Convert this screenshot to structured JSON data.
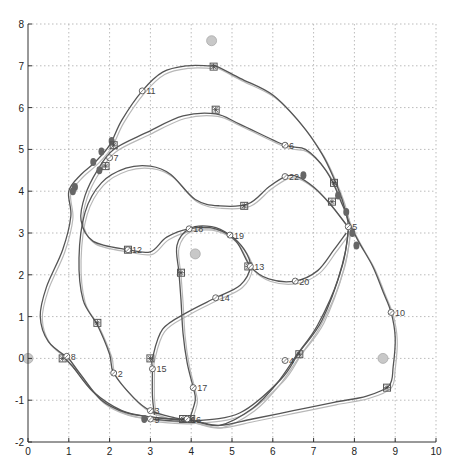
{
  "chart_data": {
    "type": "line",
    "title": "",
    "xlabel": "",
    "ylabel": "",
    "xlim": [
      0,
      10
    ],
    "ylim": [
      -2,
      8
    ],
    "x_ticks": [
      0,
      1,
      2,
      3,
      4,
      5,
      6,
      7,
      8,
      9,
      10
    ],
    "y_ticks": [
      -2,
      -1,
      0,
      1,
      2,
      3,
      4,
      5,
      6,
      7,
      8
    ],
    "grid": true,
    "legend": null,
    "colors": {
      "estimate": "#555555",
      "ground_truth": "#b8b8b8",
      "landmark": "#c8c8c8",
      "axis": "#333333",
      "grid": "#bbbbbb"
    },
    "landmarks": [
      {
        "x": 4.5,
        "y": 7.6
      },
      {
        "x": 4.1,
        "y": 2.5
      },
      {
        "x": 8.7,
        "y": 0.0
      },
      {
        "x": 0.0,
        "y": 0.0
      }
    ],
    "series": [
      {
        "name": "estimated trajectory",
        "points": [
          [
            1.0,
            0.0
          ],
          [
            0.5,
            0.4
          ],
          [
            0.3,
            1.0
          ],
          [
            0.45,
            1.7
          ],
          [
            0.85,
            2.6
          ],
          [
            1.05,
            3.4
          ],
          [
            1.0,
            4.0
          ],
          [
            1.3,
            4.4
          ],
          [
            1.65,
            4.7
          ],
          [
            2.0,
            5.1
          ],
          [
            2.3,
            5.7
          ],
          [
            2.8,
            6.4
          ],
          [
            3.3,
            6.85
          ],
          [
            3.9,
            7.0
          ],
          [
            4.45,
            7.0
          ],
          [
            4.6,
            7.0
          ],
          [
            5.2,
            6.7
          ],
          [
            6.0,
            6.3
          ],
          [
            6.7,
            5.6
          ],
          [
            7.2,
            4.9
          ],
          [
            7.5,
            4.3
          ],
          [
            7.7,
            3.8
          ],
          [
            7.85,
            3.3
          ],
          [
            8.1,
            2.8
          ],
          [
            8.45,
            2.2
          ],
          [
            8.7,
            1.6
          ],
          [
            8.9,
            1.1
          ],
          [
            9.0,
            0.5
          ],
          [
            8.95,
            -0.2
          ],
          [
            8.85,
            -0.65
          ],
          [
            8.3,
            -0.9
          ],
          [
            7.5,
            -1.05
          ],
          [
            6.5,
            -1.25
          ],
          [
            5.5,
            -1.45
          ],
          [
            4.7,
            -1.6
          ],
          [
            4.1,
            -1.5
          ],
          [
            3.5,
            -1.45
          ],
          [
            3.0,
            -1.4
          ],
          [
            2.3,
            -1.25
          ],
          [
            1.6,
            -0.8
          ],
          [
            1.1,
            -0.2
          ],
          [
            0.9,
            0.0
          ]
        ]
      },
      {
        "name": "estimated trajectory",
        "points": [
          [
            1.0,
            0.0
          ],
          [
            1.3,
            -0.4
          ],
          [
            1.8,
            -1.0
          ],
          [
            2.4,
            -1.3
          ],
          [
            3.0,
            -1.4
          ],
          [
            3.5,
            -1.45
          ],
          [
            4.0,
            -1.48
          ],
          [
            4.7,
            -1.6
          ],
          [
            5.5,
            -1.2
          ],
          [
            6.1,
            -0.6
          ],
          [
            6.6,
            0.1
          ],
          [
            7.1,
            0.8
          ],
          [
            7.6,
            1.9
          ],
          [
            7.85,
            3.1
          ],
          [
            7.65,
            3.8
          ],
          [
            7.3,
            4.5
          ],
          [
            6.8,
            5.0
          ],
          [
            6.3,
            5.1
          ],
          [
            5.2,
            5.6
          ],
          [
            4.6,
            5.85
          ],
          [
            3.8,
            5.8
          ],
          [
            2.9,
            5.4
          ],
          [
            2.1,
            5.0
          ],
          [
            1.7,
            4.5
          ],
          [
            1.4,
            3.9
          ],
          [
            1.3,
            3.3
          ],
          [
            1.6,
            2.8
          ],
          [
            2.45,
            2.6
          ],
          [
            3.0,
            2.55
          ],
          [
            3.4,
            2.9
          ],
          [
            3.95,
            3.1
          ],
          [
            4.6,
            3.1
          ],
          [
            5.1,
            2.8
          ],
          [
            5.45,
            2.2
          ],
          [
            5.9,
            1.9
          ],
          [
            6.55,
            1.85
          ],
          [
            7.1,
            2.1
          ],
          [
            7.5,
            2.6
          ],
          [
            7.8,
            3.0
          ]
        ]
      },
      {
        "name": "estimated trajectory",
        "points": [
          [
            7.8,
            3.2
          ],
          [
            7.4,
            3.7
          ],
          [
            7.0,
            4.1
          ],
          [
            6.6,
            4.35
          ],
          [
            6.3,
            4.35
          ],
          [
            5.9,
            4.1
          ],
          [
            5.4,
            3.7
          ],
          [
            4.7,
            3.65
          ],
          [
            4.1,
            3.8
          ],
          [
            3.5,
            4.4
          ],
          [
            3.0,
            4.6
          ],
          [
            2.4,
            4.55
          ],
          [
            1.8,
            4.2
          ],
          [
            1.4,
            3.5
          ],
          [
            1.25,
            2.4
          ],
          [
            1.35,
            1.4
          ],
          [
            1.7,
            0.8
          ],
          [
            2.0,
            0.1
          ],
          [
            2.1,
            -0.35
          ],
          [
            2.6,
            -0.95
          ],
          [
            3.0,
            -1.25
          ],
          [
            3.6,
            -1.42
          ],
          [
            3.95,
            -1.48
          ]
        ]
      },
      {
        "name": "estimated trajectory",
        "points": [
          [
            3.95,
            -1.48
          ],
          [
            4.1,
            -1.0
          ],
          [
            4.05,
            -0.7
          ],
          [
            3.9,
            -0.1
          ],
          [
            3.8,
            0.6
          ],
          [
            3.75,
            1.4
          ],
          [
            3.7,
            2.05
          ],
          [
            3.65,
            2.7
          ],
          [
            3.95,
            3.1
          ],
          [
            4.5,
            3.15
          ],
          [
            4.95,
            2.95
          ],
          [
            5.3,
            2.6
          ],
          [
            5.45,
            2.2
          ],
          [
            5.2,
            1.75
          ],
          [
            4.6,
            1.45
          ],
          [
            3.9,
            1.1
          ],
          [
            3.3,
            0.7
          ],
          [
            3.05,
            0.0
          ],
          [
            3.05,
            -0.25
          ],
          [
            3.05,
            -0.9
          ],
          [
            3.1,
            -1.35
          ]
        ]
      },
      {
        "name": "estimated trajectory",
        "points": [
          [
            3.0,
            -1.45
          ],
          [
            4.0,
            -1.5
          ],
          [
            5.2,
            -1.3
          ],
          [
            6.2,
            -0.5
          ],
          [
            6.65,
            0.15
          ],
          [
            7.2,
            0.9
          ],
          [
            7.7,
            2.2
          ],
          [
            7.85,
            3.05
          ]
        ]
      }
    ],
    "markers": [
      {
        "type": "square",
        "x": 4.55,
        "y": 6.98
      },
      {
        "type": "square",
        "x": 4.6,
        "y": 5.95
      },
      {
        "type": "square",
        "x": 2.1,
        "y": 5.1
      },
      {
        "type": "square",
        "x": 1.9,
        "y": 4.6
      },
      {
        "type": "square",
        "x": 7.5,
        "y": 4.2
      },
      {
        "type": "square",
        "x": 7.45,
        "y": 3.75
      },
      {
        "type": "square",
        "x": 5.3,
        "y": 3.65
      },
      {
        "type": "square",
        "x": 2.45,
        "y": 2.6
      },
      {
        "type": "square",
        "x": 3.75,
        "y": 2.05
      },
      {
        "type": "square",
        "x": 5.4,
        "y": 2.2
      },
      {
        "type": "square",
        "x": 1.7,
        "y": 0.85
      },
      {
        "type": "square",
        "x": 0.85,
        "y": 0.0
      },
      {
        "type": "square",
        "x": 3.0,
        "y": 0.0
      },
      {
        "type": "square",
        "x": 6.65,
        "y": 0.1
      },
      {
        "type": "square",
        "x": 8.8,
        "y": -0.7
      },
      {
        "type": "square",
        "x": 3.8,
        "y": -1.45
      },
      {
        "type": "square",
        "x": 4.0,
        "y": -1.45
      }
    ],
    "blobs": [
      [
        1.15,
        4.1
      ],
      [
        1.6,
        4.7
      ],
      [
        1.8,
        4.95
      ],
      [
        1.75,
        4.5
      ],
      [
        2.05,
        5.2
      ],
      [
        7.6,
        3.9
      ],
      [
        7.8,
        3.5
      ],
      [
        7.95,
        3.0
      ],
      [
        8.05,
        2.7
      ],
      [
        6.75,
        4.38
      ],
      [
        2.85,
        -1.45
      ],
      [
        1.1,
        4.0
      ]
    ],
    "point_labels": [
      {
        "id": "2",
        "x": 2.1,
        "y": -0.35
      },
      {
        "id": "3",
        "x": 3.0,
        "y": -1.25
      },
      {
        "id": "4",
        "x": 6.3,
        "y": -0.05
      },
      {
        "id": "5",
        "x": 7.85,
        "y": 3.15
      },
      {
        "id": "6",
        "x": 6.3,
        "y": 5.1
      },
      {
        "id": "7",
        "x": 2.0,
        "y": 4.8
      },
      {
        "id": "8",
        "x": 0.95,
        "y": 0.05
      },
      {
        "id": "9",
        "x": 3.0,
        "y": -1.45
      },
      {
        "id": "10",
        "x": 8.9,
        "y": 1.1
      },
      {
        "id": "11",
        "x": 2.8,
        "y": 6.4
      },
      {
        "id": "12",
        "x": 2.45,
        "y": 2.6
      },
      {
        "id": "13",
        "x": 5.45,
        "y": 2.2
      },
      {
        "id": "14",
        "x": 4.6,
        "y": 1.45
      },
      {
        "id": "15",
        "x": 3.05,
        "y": -0.25
      },
      {
        "id": "16",
        "x": 3.9,
        "y": -1.45
      },
      {
        "id": "17",
        "x": 4.05,
        "y": -0.7
      },
      {
        "id": "18",
        "x": 3.95,
        "y": 3.1
      },
      {
        "id": "19",
        "x": 4.95,
        "y": 2.95
      },
      {
        "id": "20",
        "x": 6.55,
        "y": 1.85
      },
      {
        "id": "22",
        "x": 6.3,
        "y": 4.35
      }
    ]
  }
}
